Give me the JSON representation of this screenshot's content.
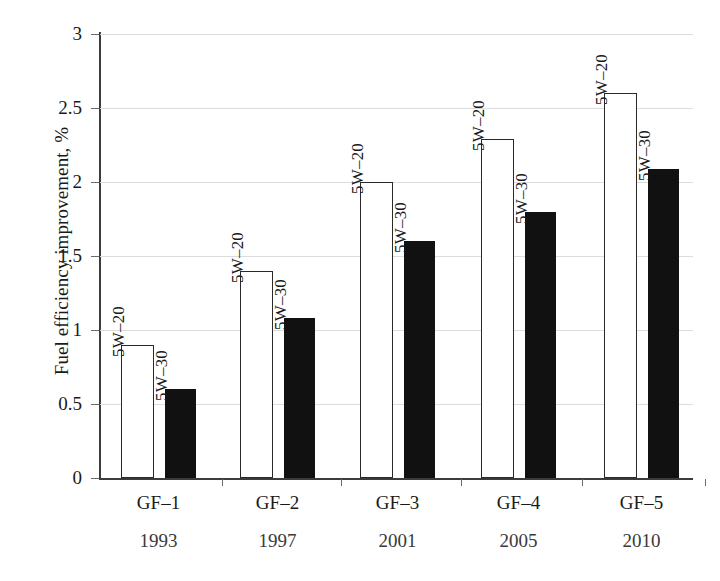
{
  "chart_data": {
    "type": "bar",
    "title": "",
    "subtitle": "",
    "xlabel": "",
    "ylabel": "Fuel efficiency improvement, %",
    "ylim": [
      0,
      3
    ],
    "ytick_labels": [
      "0",
      "0.5",
      "1",
      "1.5",
      "2",
      "2.5",
      "3"
    ],
    "ytick_values": [
      0,
      0.5,
      1,
      1.5,
      2,
      2.5,
      3
    ],
    "grid": "horizontal",
    "legend": "none",
    "categories": [
      "GF-1",
      "GF-2",
      "GF-3",
      "GF-4",
      "GF-5"
    ],
    "secondary_categories": [
      "1993",
      "1997",
      "2001",
      "2005",
      "2010"
    ],
    "series": [
      {
        "name": "5W-20",
        "style": "open",
        "values": [
          0.9,
          1.4,
          2.0,
          2.29,
          2.6
        ]
      },
      {
        "name": "5W-30",
        "style": "filled",
        "values": [
          0.6,
          1.08,
          1.6,
          1.8,
          2.09
        ]
      }
    ],
    "bar_annotations": [
      [
        "5W–20",
        "5W–30"
      ],
      [
        "5W–20",
        "5W–30"
      ],
      [
        "5W–20",
        "5W–30"
      ],
      [
        "5W–20",
        "5W–30"
      ],
      [
        "5W–20",
        "5W–30"
      ]
    ],
    "colors": {
      "open_bar_fill": "#ffffff",
      "open_bar_stroke": "#2a2a2a",
      "filled_bar_fill": "#111111",
      "gridline": "#dcdcdc",
      "axis": "#3c3c3c",
      "text": "#1a1a1a",
      "background": "#ffffff"
    }
  },
  "axis": {
    "ticks": [
      {
        "label": "3",
        "value": 3.0
      },
      {
        "label": "2.5",
        "value": 2.5
      },
      {
        "label": "2",
        "value": 2.0
      },
      {
        "label": "1.5",
        "value": 1.5
      },
      {
        "label": "1",
        "value": 1.0
      },
      {
        "label": "0.5",
        "value": 0.5
      },
      {
        "label": "0",
        "value": 0.0
      }
    ]
  },
  "groups": [
    {
      "category": "GF-1",
      "year": "1993",
      "bars": [
        {
          "label": "5W–20",
          "value": 0.9,
          "style": "open"
        },
        {
          "label": "5W–30",
          "value": 0.6,
          "style": "filled"
        }
      ]
    },
    {
      "category": "GF-2",
      "year": "1997",
      "bars": [
        {
          "label": "5W–20",
          "value": 1.4,
          "style": "open"
        },
        {
          "label": "5W–30",
          "value": 1.08,
          "style": "filled"
        }
      ]
    },
    {
      "category": "GF-3",
      "year": "2001",
      "bars": [
        {
          "label": "5W–20",
          "value": 2.0,
          "style": "open"
        },
        {
          "label": "5W–30",
          "value": 1.6,
          "style": "filled"
        }
      ]
    },
    {
      "category": "GF-4",
      "year": "2005",
      "bars": [
        {
          "label": "5W–20",
          "value": 2.29,
          "style": "open"
        },
        {
          "label": "5W–30",
          "value": 1.8,
          "style": "filled"
        }
      ]
    },
    {
      "category": "GF-5",
      "year": "2010",
      "bars": [
        {
          "label": "5W–20",
          "value": 2.6,
          "style": "open"
        },
        {
          "label": "5W–30",
          "value": 2.09,
          "style": "filled"
        }
      ]
    }
  ]
}
